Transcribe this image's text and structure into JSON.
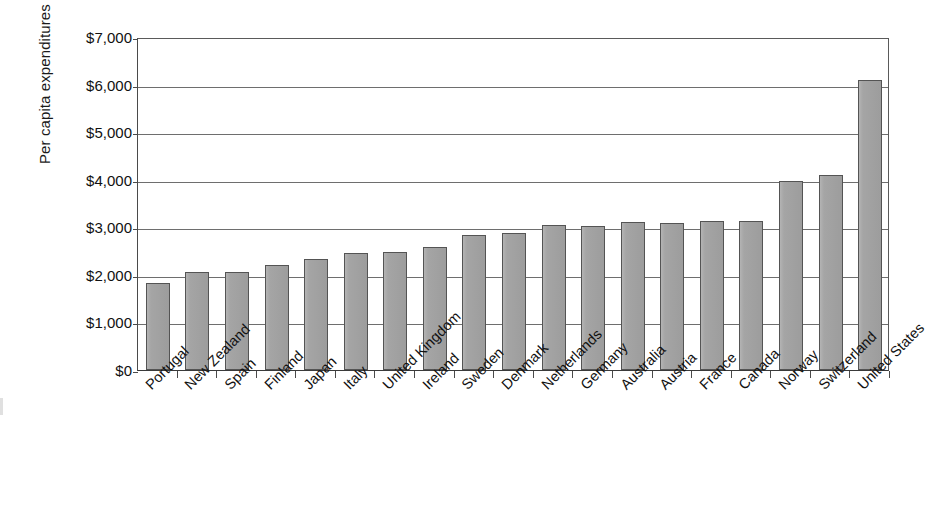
{
  "chart_data": {
    "type": "bar",
    "title": "",
    "xlabel": "",
    "ylabel": "Per capita expenditures",
    "ylim": [
      0,
      7000
    ],
    "ytick_values": [
      0,
      1000,
      2000,
      3000,
      4000,
      5000,
      6000,
      7000
    ],
    "ytick_labels": [
      "$0",
      "$1,000",
      "$2,000",
      "$3,000",
      "$4,000",
      "$5,000",
      "$6,000",
      "$7,000"
    ],
    "grid": true,
    "legend": "none",
    "bar_color": "#a3a3a3",
    "bar_edge_color": "#545454",
    "categories": [
      "Portugal",
      "New Zealand",
      "Spain",
      "Finland",
      "Japan",
      "Italy",
      "United Kingdom",
      "Ireland",
      "Sweden",
      "Denmark",
      "Netherlands",
      "Germany",
      "Australia",
      "Austria",
      "France",
      "Canada",
      "Norway",
      "Switzerland",
      "United States"
    ],
    "values": [
      1830,
      2070,
      2070,
      2210,
      2340,
      2450,
      2490,
      2590,
      2830,
      2870,
      3040,
      3030,
      3110,
      3100,
      3130,
      3130,
      3980,
      4100,
      6100
    ]
  }
}
